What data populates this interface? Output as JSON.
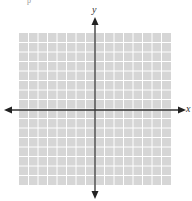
{
  "diagram": {
    "type": "coordinate-plane",
    "grid": {
      "columns": 16,
      "rows": 16,
      "cell_size_px": 9.5,
      "fill_color": "#d6d6d6",
      "line_color": "#ffffff"
    },
    "axes": {
      "x_label": "x",
      "y_label": "y",
      "color": "#333333",
      "arrows": "both-ends"
    },
    "corner_mark": "p"
  }
}
